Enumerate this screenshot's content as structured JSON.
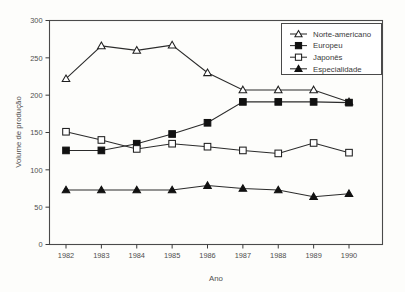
{
  "chart_data": {
    "type": "line",
    "title": "",
    "xlabel": "Ano",
    "ylabel": "Volume de produção",
    "categories": [
      1982,
      1983,
      1984,
      1985,
      1986,
      1987,
      1988,
      1989,
      1990
    ],
    "x_tick_labels": [
      "1982",
      "1983",
      "1984",
      "1985",
      "1986",
      "1987",
      "1988",
      "1989",
      "1990"
    ],
    "y_tick_labels": [
      "0",
      "50",
      "100",
      "150",
      "200",
      "250",
      "300"
    ],
    "y_ticks": [
      0,
      50,
      100,
      150,
      200,
      250,
      300
    ],
    "ylim": [
      0,
      300
    ],
    "grid": false,
    "legend_position": "top-right",
    "series": [
      {
        "name": "Norte-americano",
        "marker": "open-triangle",
        "color": "#1f1f1f",
        "values": [
          222,
          266,
          260,
          267,
          230,
          207,
          207,
          207,
          191
        ]
      },
      {
        "name": "Europeu",
        "marker": "filled-square",
        "color": "#111111",
        "values": [
          126,
          126,
          135,
          148,
          163,
          191,
          191,
          191,
          190
        ]
      },
      {
        "name": "Japonês",
        "marker": "open-square",
        "color": "#1f1f1f",
        "values": [
          151,
          140,
          128,
          135,
          131,
          126,
          122,
          136,
          123
        ]
      },
      {
        "name": "Especialidade",
        "marker": "filled-triangle",
        "color": "#111111",
        "values": [
          73,
          73,
          73,
          73,
          79,
          75,
          73,
          64,
          68
        ]
      }
    ]
  },
  "legend": {
    "items": [
      {
        "label": "Norte-americano"
      },
      {
        "label": "Europeu"
      },
      {
        "label": "Japonês"
      },
      {
        "label": "Especialidade"
      }
    ]
  }
}
